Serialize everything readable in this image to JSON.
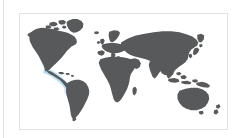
{
  "figure": {
    "type": "world-map-thumbnail",
    "title": "",
    "caption": "",
    "frame_border_color": "#e3e3e3",
    "background_color": "#ffffff",
    "left_rule_color": "#e4e4e4"
  },
  "map": {
    "projection": "equirectangular",
    "land_color": "#58595b",
    "ocean_color": "#ffffff",
    "landmasses": [
      "North America",
      "South America",
      "Greenland",
      "Europe",
      "Africa",
      "Asia",
      "Australia",
      "New Zealand",
      "Indonesia",
      "Japan",
      "British Isles",
      "Madagascar"
    ]
  },
  "highlight": {
    "label": "Eastern Pacific coastal region",
    "color": "#b3dbf0",
    "soft_color": "#cfe8f6",
    "location": "Pacific coast of Mexico, Central America and western South America"
  }
}
